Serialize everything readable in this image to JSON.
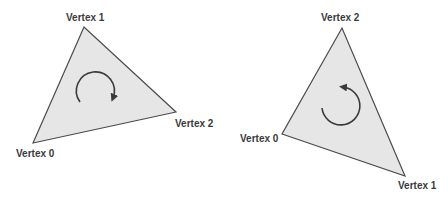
{
  "diagram": {
    "colors": {
      "triangle_fill": "#e6e6e6",
      "triangle_stroke": "#4a4a4a",
      "arrow": "#3a3a3a",
      "label": "#3a3a3a"
    },
    "triangles": [
      {
        "name": "clockwise",
        "winding": "clockwise",
        "vertices": [
          {
            "label": "Vertex 0",
            "x": 33,
            "y": 143
          },
          {
            "label": "Vertex 1",
            "x": 84,
            "y": 27
          },
          {
            "label": "Vertex 2",
            "x": 176,
            "y": 112
          }
        ]
      },
      {
        "name": "counter-clockwise",
        "winding": "counter-clockwise",
        "vertices": [
          {
            "label": "Vertex 0",
            "x": 282,
            "y": 134
          },
          {
            "label": "Vertex 1",
            "x": 405,
            "y": 176
          },
          {
            "label": "Vertex 2",
            "x": 342,
            "y": 28
          }
        ]
      }
    ]
  }
}
